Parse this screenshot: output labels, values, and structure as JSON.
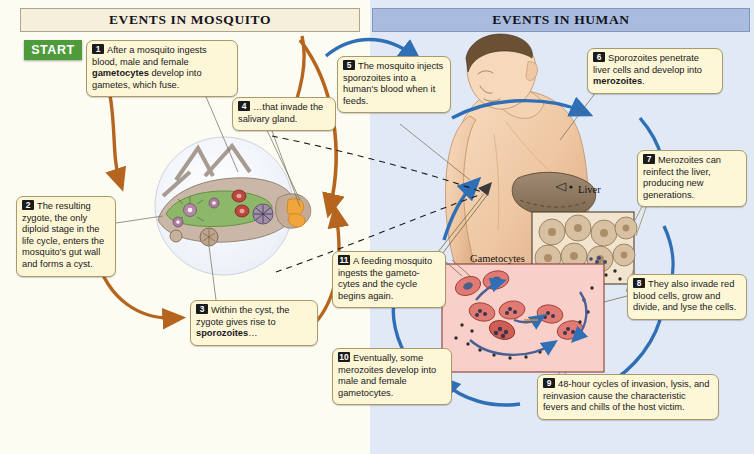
{
  "diagram": {
    "panels": [
      {
        "id": "mosquito",
        "header": "EVENTS IN MOSQUITO",
        "bg": "#fdfcf3",
        "header_bg": "#f6efdc"
      },
      {
        "id": "human",
        "header": "EVENTS IN HUMAN",
        "bg": "#e2e9f6",
        "header_bg": "#a8bce0"
      }
    ],
    "start_label": "START",
    "start_color": "#4e9b3b",
    "arrow_colors": {
      "mosquito": "#b5651d",
      "human": "#2f6fb5",
      "dashed": "#1a1a1a"
    },
    "steps": [
      {
        "num": "1",
        "parts": [
          {
            "text": "After a mosquito ingests blood, male and female ",
            "bold": false
          },
          {
            "text": "gametocytes",
            "bold": true
          },
          {
            "text": " develop into gametes, which fuse.",
            "bold": false
          }
        ]
      },
      {
        "num": "2",
        "parts": [
          {
            "text": "The resulting zygote, the only diploid stage in the life cycle, enters the mosquito's gut wall and forms a cyst.",
            "bold": false
          }
        ]
      },
      {
        "num": "3",
        "parts": [
          {
            "text": "Within the cyst, the zygote gives rise to ",
            "bold": false
          },
          {
            "text": "sporozoites",
            "bold": true
          },
          {
            "text": "…",
            "bold": false
          }
        ]
      },
      {
        "num": "4",
        "parts": [
          {
            "text": "…that invade the salivary gland.",
            "bold": false
          }
        ]
      },
      {
        "num": "5",
        "parts": [
          {
            "text": "The mosquito injects sporozoites into a human's blood when it feeds.",
            "bold": false
          }
        ]
      },
      {
        "num": "6",
        "parts": [
          {
            "text": "Sporozoites penetrate liver cells and develop into ",
            "bold": false
          },
          {
            "text": "merozoites",
            "bold": true
          },
          {
            "text": ".",
            "bold": false
          }
        ]
      },
      {
        "num": "7",
        "parts": [
          {
            "text": "Merozoites can reinfect the liver, producing new generations.",
            "bold": false
          }
        ]
      },
      {
        "num": "8",
        "parts": [
          {
            "text": "They also invade red blood cells, grow and divide, and lyse the cells.",
            "bold": false
          }
        ]
      },
      {
        "num": "9",
        "parts": [
          {
            "text": "48-hour cycles of invasion, lysis, and reinvasion cause the characteristic fevers and chills of the host victim.",
            "bold": false
          }
        ]
      },
      {
        "num": "10",
        "parts": [
          {
            "text": "Eventually, some merozoites develop into male and female gametocytes.",
            "bold": false
          }
        ]
      },
      {
        "num": "11",
        "parts": [
          {
            "text": "A feeding mosquito ingests the gameto-cytes and the cycle begins again.",
            "bold": false
          }
        ]
      }
    ],
    "art_labels": [
      {
        "id": "liver",
        "text": "Liver"
      },
      {
        "id": "gametocytes",
        "text": "Gametocytes"
      }
    ]
  }
}
